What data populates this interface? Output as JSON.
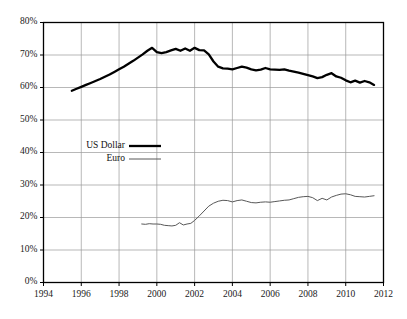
{
  "chart_data": {
    "type": "line",
    "title": "",
    "subtitle": "",
    "xlabel": "",
    "ylabel": "",
    "xlim": [
      1994,
      2012
    ],
    "ylim": [
      0,
      80
    ],
    "grid": true,
    "legend_position": "center-left",
    "x_ticks": [
      "1994",
      "1996",
      "1998",
      "2000",
      "2002",
      "2004",
      "2006",
      "2008",
      "2010",
      "2012"
    ],
    "x_tick_values": [
      1994,
      1996,
      1998,
      2000,
      2002,
      2004,
      2006,
      2008,
      2010,
      2012
    ],
    "y_ticks": [
      "0%",
      "10%",
      "20%",
      "30%",
      "40%",
      "50%",
      "60%",
      "70%",
      "80%"
    ],
    "y_tick_values": [
      0,
      10,
      20,
      30,
      40,
      50,
      60,
      70,
      80
    ],
    "series": [
      {
        "name": "US Dollar",
        "color": "#000000",
        "width": 2.3,
        "x": [
          1995.5,
          1995.75,
          1996.0,
          1996.25,
          1996.5,
          1996.75,
          1997.0,
          1997.25,
          1997.5,
          1997.75,
          1998.0,
          1998.25,
          1998.5,
          1998.75,
          1999.0,
          1999.25,
          1999.5,
          1999.75,
          2000.0,
          2000.25,
          2000.5,
          2000.75,
          2001.0,
          2001.25,
          2001.5,
          2001.75,
          2002.0,
          2002.25,
          2002.5,
          2002.75,
          2003.0,
          2003.25,
          2003.5,
          2003.75,
          2004.0,
          2004.25,
          2004.5,
          2004.75,
          2005.0,
          2005.25,
          2005.5,
          2005.75,
          2006.0,
          2006.25,
          2006.5,
          2006.75,
          2007.0,
          2007.25,
          2007.5,
          2007.75,
          2008.0,
          2008.25,
          2008.5,
          2008.75,
          2009.0,
          2009.25,
          2009.5,
          2009.75,
          2010.0,
          2010.25,
          2010.5,
          2010.75,
          2011.0,
          2011.25,
          2011.5
        ],
        "values": [
          59.0,
          59.6,
          60.2,
          60.8,
          61.4,
          62.0,
          62.6,
          63.3,
          64.0,
          64.8,
          65.6,
          66.4,
          67.3,
          68.2,
          69.2,
          70.2,
          71.3,
          72.2,
          70.9,
          70.6,
          70.9,
          71.4,
          71.9,
          71.3,
          72.0,
          71.3,
          72.2,
          71.5,
          71.4,
          70.2,
          68.0,
          66.4,
          65.9,
          65.8,
          65.6,
          66.0,
          66.4,
          66.1,
          65.6,
          65.3,
          65.5,
          66.0,
          65.6,
          65.5,
          65.4,
          65.6,
          65.2,
          64.9,
          64.6,
          64.2,
          63.8,
          63.4,
          62.9,
          63.2,
          63.9,
          64.4,
          63.4,
          63.0,
          62.2,
          61.6,
          62.1,
          61.5,
          62.0,
          61.6,
          60.8
        ]
      },
      {
        "name": "Euro",
        "color": "#585858",
        "width": 1.0,
        "x": [
          1999.2,
          1999.4,
          1999.6,
          1999.8,
          2000.0,
          2000.2,
          2000.4,
          2000.6,
          2000.8,
          2001.0,
          2001.2,
          2001.4,
          2001.6,
          2001.8,
          2002.0,
          2002.25,
          2002.5,
          2002.75,
          2003.0,
          2003.25,
          2003.5,
          2003.75,
          2004.0,
          2004.25,
          2004.5,
          2004.75,
          2005.0,
          2005.25,
          2005.5,
          2005.75,
          2006.0,
          2006.25,
          2006.5,
          2006.75,
          2007.0,
          2007.25,
          2007.5,
          2007.75,
          2008.0,
          2008.25,
          2008.5,
          2008.75,
          2009.0,
          2009.25,
          2009.5,
          2009.75,
          2010.0,
          2010.25,
          2010.5,
          2010.75,
          2011.0,
          2011.25,
          2011.5
        ],
        "values": [
          18.0,
          17.9,
          18.1,
          18.0,
          18.0,
          17.9,
          17.6,
          17.5,
          17.4,
          17.6,
          18.4,
          17.7,
          18.0,
          18.2,
          19.1,
          20.5,
          22.0,
          23.5,
          24.4,
          25.0,
          25.3,
          25.2,
          24.8,
          25.2,
          25.4,
          25.0,
          24.6,
          24.5,
          24.7,
          24.8,
          24.7,
          24.9,
          25.1,
          25.3,
          25.4,
          25.8,
          26.2,
          26.4,
          26.5,
          26.1,
          25.2,
          25.9,
          25.4,
          26.3,
          26.8,
          27.2,
          27.3,
          27.0,
          26.5,
          26.4,
          26.3,
          26.5,
          26.7
        ]
      }
    ]
  },
  "legend": {
    "items": [
      {
        "label": "US Dollar",
        "style": "thick-black-line"
      },
      {
        "label": "Euro",
        "style": "thin-gray-line"
      }
    ]
  }
}
